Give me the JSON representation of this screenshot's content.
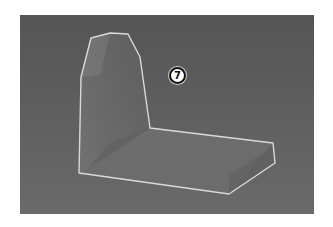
{
  "viewport": {
    "background_top": "#555555",
    "background_bottom": "#6a6a6a",
    "outline_color": "#d9d9d9"
  },
  "callout": {
    "label": "7"
  },
  "object": {
    "name": "L-shaped seat solid",
    "backrest_points": "61,62 71,23 90,18 108,19 120,42 130,113 90,128 60,162",
    "seat_points": "59,158 130,113 253,128 255,148 209,179",
    "outline_points": "61,62 71,23 90,18 108,19 120,42 130,113 253,128 255,148 209,179 59,158"
  }
}
